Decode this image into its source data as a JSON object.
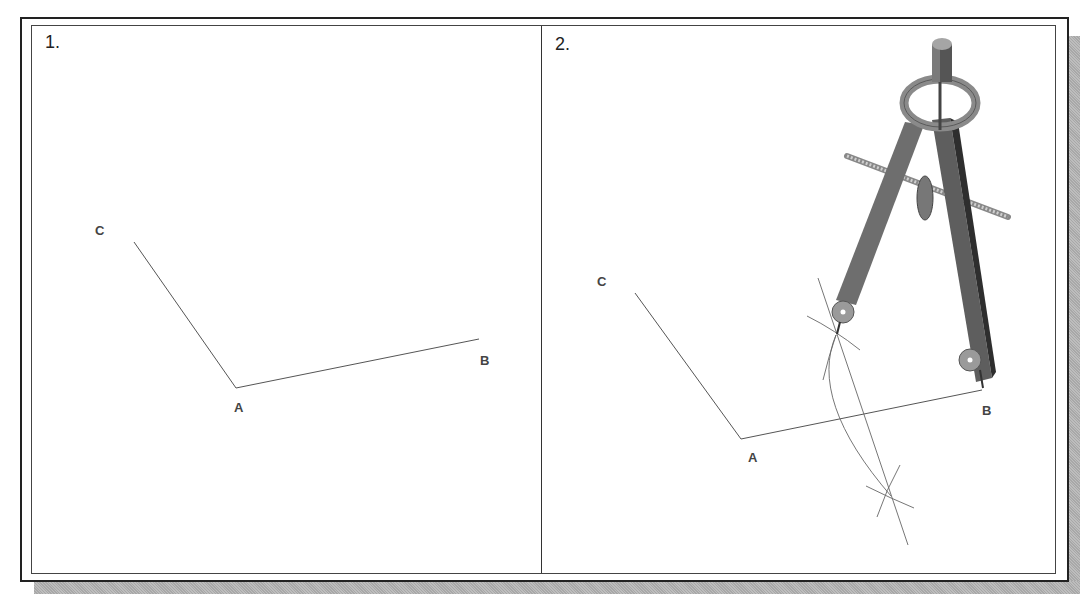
{
  "figure": {
    "panels": [
      {
        "number": "1.",
        "points": {
          "C": {
            "label": "C",
            "x": 134,
            "y": 242
          },
          "A": {
            "label": "A",
            "x": 236,
            "y": 388
          },
          "B": {
            "label": "B",
            "x": 479,
            "y": 339
          }
        }
      },
      {
        "number": "2.",
        "points": {
          "C": {
            "label": "C",
            "x": 635,
            "y": 293
          },
          "A": {
            "label": "A",
            "x": 741,
            "y": 439
          },
          "B": {
            "label": "B",
            "x": 982,
            "y": 390
          }
        },
        "tool": "compass-icon"
      }
    ],
    "colors": {
      "line": "#555555",
      "frame": "#222222",
      "shadow": "#b0b0b0",
      "compass_dark": "#5a5a5a",
      "compass_mid": "#7d7d7d",
      "compass_light": "#bdbdbd"
    }
  }
}
